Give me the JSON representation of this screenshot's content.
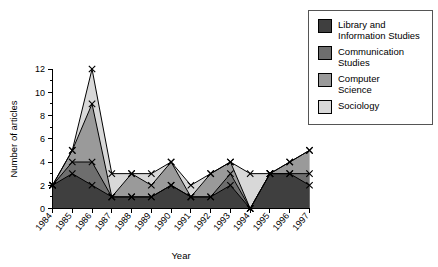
{
  "chart_data": {
    "type": "area",
    "title": "",
    "xlabel": "Year",
    "ylabel": "Number of articles",
    "categories": [
      "1984",
      "1985",
      "1986",
      "1987",
      "1988",
      "1989",
      "1990",
      "1991",
      "1992",
      "1993",
      "1994",
      "1995",
      "1996",
      "1997"
    ],
    "ylim": [
      0,
      12
    ],
    "yticks": [
      0,
      2,
      4,
      6,
      8,
      10,
      12
    ],
    "xlim_labels_rotated": true,
    "grid": false,
    "legend_position": "top-right",
    "stacked": true,
    "series": [
      {
        "name": "Library and Information Studies",
        "color": "#3f3f3f",
        "values": [
          2,
          3,
          2,
          1,
          1,
          1,
          2,
          1,
          1,
          2,
          0,
          3,
          3,
          2
        ]
      },
      {
        "name": "Communication Studies",
        "color": "#6e6e6e",
        "values": [
          2,
          4,
          4,
          1,
          1,
          1,
          2,
          1,
          1,
          3,
          0,
          3,
          3,
          3
        ]
      },
      {
        "name": "Computer Science",
        "color": "#9a9a9a",
        "values": [
          2,
          5,
          9,
          1,
          3,
          2,
          4,
          1,
          3,
          4,
          0,
          3,
          4,
          5
        ]
      },
      {
        "name": "Sociology",
        "color": "#d8d8d8",
        "values": [
          2,
          5,
          12,
          3,
          3,
          3,
          4,
          2,
          3,
          4,
          3,
          3,
          4,
          5
        ]
      }
    ]
  },
  "legend": {
    "items": [
      {
        "label_line1": "Library and",
        "label_line2": "Information Studies",
        "color": "#3f3f3f"
      },
      {
        "label_line1": "Communication",
        "label_line2": "Studies",
        "color": "#6e6e6e"
      },
      {
        "label_line1": "Computer",
        "label_line2": "Science",
        "color": "#9a9a9a"
      },
      {
        "label_line1": "Sociology",
        "label_line2": "",
        "color": "#d8d8d8"
      }
    ]
  },
  "axes": {
    "y_title": "Number of articles",
    "x_title": "Year",
    "y_tick_labels": [
      "0",
      "2",
      "4",
      "6",
      "8",
      "10",
      "12"
    ],
    "x_tick_labels": [
      "1984",
      "1985",
      "1986",
      "1987",
      "1988",
      "1989",
      "1990",
      "1991",
      "1992",
      "1993",
      "1994",
      "1995",
      "1996",
      "1997"
    ]
  }
}
